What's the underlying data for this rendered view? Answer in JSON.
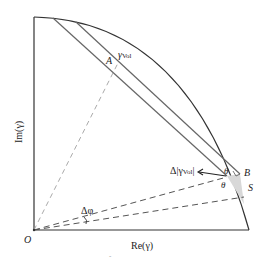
{
  "diagram": {
    "axes": {
      "x_label": "Re(γ)",
      "y_label": "Im(γ)"
    },
    "points": {
      "origin": "O",
      "A": "A",
      "B": "B",
      "S": "S"
    },
    "labels": {
      "gamma_vol": "γ",
      "gamma_vol_sub": "Vol",
      "delta_gamma_vol": "Δ|γ",
      "delta_gamma_vol_sub": "Vol",
      "delta_gamma_vol_end": "|",
      "delta_phi": "Δφ",
      "theta_top": "θ",
      "theta_bottom": "θ",
      "tick_mark": "ˆ"
    },
    "colors": {
      "line": "#333333",
      "dashed": "#555555",
      "light_dashed": "#aaaaaa",
      "shade": "#d8d8d8"
    }
  }
}
